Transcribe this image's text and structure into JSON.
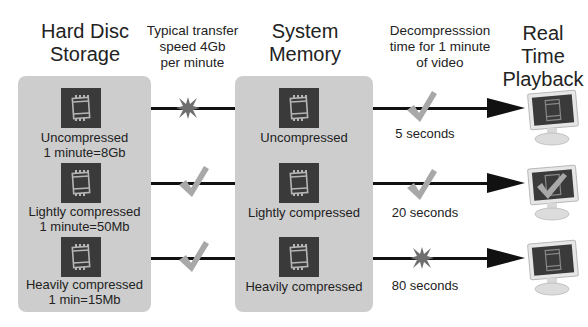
{
  "headings": {
    "storage": [
      "Hard Disc",
      "Storage"
    ],
    "transfer": [
      "Typical transfer",
      "speed 4Gb",
      "per minute"
    ],
    "memory": [
      "System",
      "Memory"
    ],
    "decompression": [
      "Decompresssion",
      "time for 1 minute",
      "of video"
    ],
    "playback": [
      "Real Time",
      "Playback"
    ]
  },
  "storage_items": [
    {
      "line1": "Uncompressed",
      "line2": "1 minute=8Gb"
    },
    {
      "line1": "Lightly compressed",
      "line2": "1 minute=50Mb"
    },
    {
      "line1": "Heavily compressed",
      "line2": "1 min=15Mb"
    }
  ],
  "memory_items": [
    {
      "label": "Uncompressed"
    },
    {
      "label": "Lightly compressed"
    },
    {
      "label": "Heavily compressed"
    }
  ],
  "transfer_status": [
    "cross-icon",
    "check-icon",
    "check-icon"
  ],
  "decompression": [
    {
      "time": "5 seconds",
      "status": "check-icon"
    },
    {
      "time": "20 seconds",
      "status": "check-icon"
    },
    {
      "time": "80 seconds",
      "status": "cross-icon"
    }
  ],
  "playback_result": [
    "cross-icon",
    "check-icon",
    "cross-icon"
  ],
  "colors": {
    "panel": "#cdcdcd",
    "film_icon": "#3a3a3a",
    "check": "#a8a8a8",
    "cross": "#6e6e6e",
    "arrow": "#111111"
  }
}
